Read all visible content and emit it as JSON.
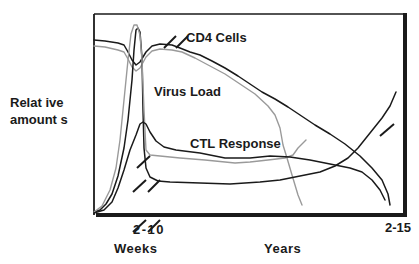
{
  "chart_data": {
    "type": "line",
    "title": "",
    "ylabel": "Relative amounts",
    "ylabel_lines": [
      "Relat ive",
      "amount s"
    ],
    "xlabel_left": "Weeks",
    "xlabel_right": "Years",
    "x_ticks": [
      "2-10",
      "2-15"
    ],
    "axis_breaks": true,
    "grid": false,
    "legend": "inline labels",
    "series": [
      {
        "name": "CD4 Cells",
        "color": "#1a1a1a",
        "label_pos": [
          186,
          40
        ],
        "points": [
          [
            94,
            40
          ],
          [
            105,
            41
          ],
          [
            118,
            43
          ],
          [
            124,
            45
          ],
          [
            128,
            52
          ],
          [
            132,
            60
          ],
          [
            136,
            65
          ],
          [
            140,
            62
          ],
          [
            146,
            52
          ],
          [
            152,
            46
          ],
          [
            160,
            44
          ],
          [
            172,
            45
          ],
          [
            180,
            48
          ],
          [
            190,
            52
          ],
          [
            200,
            55
          ],
          [
            212,
            61
          ],
          [
            225,
            68
          ],
          [
            238,
            76
          ],
          [
            250,
            84
          ],
          [
            262,
            92
          ],
          [
            275,
            99
          ],
          [
            288,
            107
          ],
          [
            300,
            115
          ],
          [
            315,
            125
          ],
          [
            330,
            134
          ],
          [
            345,
            144
          ],
          [
            360,
            156
          ],
          [
            372,
            168
          ],
          [
            382,
            180
          ],
          [
            388,
            194
          ],
          [
            390,
            205
          ]
        ]
      },
      {
        "name": "CD4 Cells (shadow)",
        "color": "#9a9a9a",
        "points": [
          [
            94,
            46
          ],
          [
            105,
            47
          ],
          [
            118,
            50
          ],
          [
            124,
            52
          ],
          [
            128,
            59
          ],
          [
            132,
            67
          ],
          [
            136,
            71
          ],
          [
            140,
            68
          ],
          [
            146,
            57
          ],
          [
            152,
            51
          ],
          [
            160,
            49
          ],
          [
            172,
            50
          ],
          [
            182,
            52
          ],
          [
            195,
            58
          ],
          [
            210,
            66
          ],
          [
            225,
            74
          ],
          [
            240,
            84
          ],
          [
            255,
            94
          ],
          [
            268,
            106
          ],
          [
            275,
            115
          ],
          [
            280,
            128
          ],
          [
            283,
            145
          ],
          [
            287,
            158
          ],
          [
            292,
            175
          ],
          [
            298,
            195
          ],
          [
            302,
            205
          ]
        ]
      },
      {
        "name": "Virus Load",
        "color": "#1a1a1a",
        "label_pos": [
          153,
          94
        ],
        "points": [
          [
            94,
            212
          ],
          [
            100,
            210
          ],
          [
            106,
            204
          ],
          [
            112,
            194
          ],
          [
            118,
            176
          ],
          [
            124,
            148
          ],
          [
            128,
            120
          ],
          [
            132,
            80
          ],
          [
            134,
            50
          ],
          [
            136,
            30
          ],
          [
            138,
            28
          ],
          [
            140,
            32
          ],
          [
            142,
            58
          ],
          [
            143,
            110
          ],
          [
            144,
            148
          ],
          [
            146,
            168
          ],
          [
            150,
            177
          ],
          [
            158,
            181
          ],
          [
            170,
            182
          ],
          [
            200,
            183
          ],
          [
            230,
            184
          ],
          [
            260,
            182
          ],
          [
            280,
            180
          ],
          [
            300,
            176
          ],
          [
            320,
            172
          ],
          [
            335,
            166
          ],
          [
            348,
            158
          ],
          [
            358,
            148
          ],
          [
            366,
            138
          ],
          [
            374,
            128
          ],
          [
            382,
            118
          ],
          [
            390,
            106
          ],
          [
            396,
            92
          ]
        ]
      },
      {
        "name": "Virus Load (shadow)",
        "color": "#9a9a9a",
        "points": [
          [
            94,
            212
          ],
          [
            102,
            206
          ],
          [
            110,
            190
          ],
          [
            116,
            168
          ],
          [
            120,
            140
          ],
          [
            124,
            100
          ],
          [
            128,
            60
          ],
          [
            131,
            34
          ],
          [
            134,
            25
          ],
          [
            137,
            25
          ],
          [
            140,
            35
          ],
          [
            142,
            60
          ],
          [
            144,
            110
          ],
          [
            146,
            150
          ],
          [
            150,
            155
          ],
          [
            160,
            156
          ],
          [
            180,
            158
          ],
          [
            205,
            160
          ],
          [
            235,
            163
          ],
          [
            250,
            162
          ],
          [
            268,
            160
          ],
          [
            285,
            158
          ],
          [
            293,
            155
          ],
          [
            298,
            148
          ],
          [
            306,
            140
          ]
        ]
      },
      {
        "name": "CTL Response",
        "color": "#1a1a1a",
        "label_pos": [
          190,
          146
        ],
        "points": [
          [
            94,
            213
          ],
          [
            104,
            210
          ],
          [
            112,
            202
          ],
          [
            118,
            188
          ],
          [
            124,
            170
          ],
          [
            130,
            150
          ],
          [
            136,
            135
          ],
          [
            140,
            124
          ],
          [
            143,
            122
          ],
          [
            146,
            124
          ],
          [
            150,
            132
          ],
          [
            156,
            141
          ],
          [
            164,
            147
          ],
          [
            176,
            150
          ],
          [
            200,
            153
          ],
          [
            225,
            158
          ],
          [
            250,
            158
          ],
          [
            270,
            156
          ],
          [
            290,
            157
          ],
          [
            310,
            160
          ],
          [
            330,
            164
          ],
          [
            350,
            168
          ],
          [
            362,
            172
          ],
          [
            372,
            180
          ],
          [
            380,
            190
          ],
          [
            385,
            200
          ]
        ]
      }
    ],
    "axis_break_marks": [
      [
        133,
        192,
        146,
        180
      ],
      [
        137,
        168,
        150,
        156
      ],
      [
        148,
        192,
        160,
        180
      ],
      [
        133,
        232,
        146,
        220
      ],
      [
        148,
        232,
        160,
        220
      ],
      [
        164,
        48,
        176,
        36
      ],
      [
        176,
        48,
        188,
        36
      ],
      [
        380,
        136,
        394,
        124
      ]
    ],
    "frame": {
      "left": 94,
      "top": 14,
      "right": 406,
      "bottom": 215
    },
    "colors": {
      "dark": "#1a1a1a",
      "gray": "#9a9a9a",
      "background": "#ffffff"
    }
  }
}
